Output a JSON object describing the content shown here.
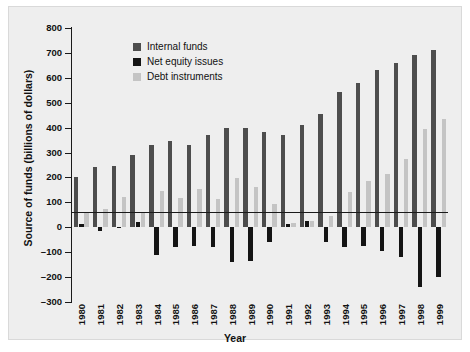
{
  "chart_data": {
    "type": "bar",
    "title": "",
    "xlabel": "Year",
    "ylabel": "Source of funds (billions of dollars)",
    "ylim": [
      -300,
      800
    ],
    "ytick_step": 100,
    "yticks": [
      800,
      700,
      600,
      500,
      400,
      300,
      200,
      100,
      0,
      -100,
      -200,
      -300
    ],
    "ytick_labels": [
      "800",
      "700",
      "600",
      "500",
      "400",
      "300",
      "200",
      "100",
      "0",
      "–100",
      "–200",
      "–300"
    ],
    "grid": false,
    "legend_position": "top-center",
    "categories": [
      "1980",
      "1981",
      "1982",
      "1983",
      "1984",
      "1985",
      "1986",
      "1987",
      "1988",
      "1989",
      "1990",
      "1991",
      "1992",
      "1993",
      "1994",
      "1995",
      "1996",
      "1997",
      "1998",
      "1999"
    ],
    "series": [
      {
        "name": "Internal funds",
        "color": "#4d4d4d",
        "values": [
          200,
          240,
          245,
          290,
          330,
          348,
          332,
          372,
          400,
          398,
          382,
          370,
          412,
          455,
          545,
          580,
          630,
          660,
          690,
          710
        ]
      },
      {
        "name": "Net equity issues",
        "color": "#141414",
        "values": [
          12,
          -15,
          -2,
          20,
          -110,
          -80,
          -75,
          -80,
          -140,
          -135,
          -60,
          15,
          25,
          -60,
          -80,
          -75,
          -95,
          -120,
          -240,
          -200
        ]
      },
      {
        "name": "Debt instruments",
        "color": "#c4c4c4",
        "values": [
          60,
          72,
          120,
          58,
          145,
          118,
          155,
          115,
          198,
          160,
          95,
          18,
          25,
          45,
          140,
          185,
          215,
          275,
          395,
          435
        ]
      }
    ]
  },
  "legend": {
    "items": [
      {
        "label": "Internal funds",
        "color": "#4d4d4d"
      },
      {
        "label": "Net equity issues",
        "color": "#141414"
      },
      {
        "label": "Debt instruments",
        "color": "#c4c4c4"
      }
    ]
  },
  "axes": {
    "x_title": "Year",
    "y_title": "Source of funds (billions of dollars)"
  }
}
